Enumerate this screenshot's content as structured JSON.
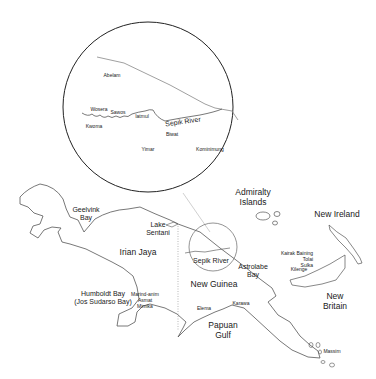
{
  "map": {
    "inset": {
      "labels": [
        {
          "id": "abelam",
          "text": "Abelam",
          "x": 112,
          "y": 76
        },
        {
          "id": "wosera",
          "text": "Wosera",
          "x": 99,
          "y": 110
        },
        {
          "id": "sawos",
          "text": "Sawos",
          "x": 118,
          "y": 113
        },
        {
          "id": "iatmul",
          "text": "Iatmul",
          "x": 142,
          "y": 117
        },
        {
          "id": "kwoma",
          "text": "Kwoma",
          "x": 94,
          "y": 127
        },
        {
          "id": "sepik-river-inset",
          "text": "Sepik River",
          "x": 183,
          "y": 122
        },
        {
          "id": "biwat",
          "text": "Biwat",
          "x": 172,
          "y": 135
        },
        {
          "id": "yimar",
          "text": "Yimar",
          "x": 148,
          "y": 150
        },
        {
          "id": "kominimung",
          "text": "Kominimung",
          "x": 210,
          "y": 150
        }
      ]
    },
    "regions": [
      {
        "id": "geelvink-bay",
        "text": "Geelvink\nBay",
        "x": 86,
        "y": 214,
        "size": "md"
      },
      {
        "id": "lake-sentani",
        "text": "Lake\nSentani",
        "x": 158,
        "y": 229,
        "size": "md"
      },
      {
        "id": "irian-jaya",
        "text": "Irian Jaya",
        "x": 138,
        "y": 253,
        "size": "lg"
      },
      {
        "id": "humboldt-bay",
        "text": "Humboldt Bay\n(Jos Sudarso Bay)",
        "x": 103,
        "y": 298,
        "size": "md"
      },
      {
        "id": "marind-anim",
        "text": "Marind-anim\nAsmat\nMimika",
        "x": 145,
        "y": 301,
        "size": "sm"
      },
      {
        "id": "admiralty-islands",
        "text": "Admiralty\nIslands",
        "x": 253,
        "y": 198,
        "size": "lg"
      },
      {
        "id": "new-ireland",
        "text": "New Ireland",
        "x": 337,
        "y": 215,
        "size": "lg"
      },
      {
        "id": "sepik-river",
        "text": "Sepik River",
        "x": 211,
        "y": 261,
        "size": "md"
      },
      {
        "id": "astrolabe-bay",
        "text": "Astrolabe\nBay",
        "x": 253,
        "y": 271,
        "size": "md"
      },
      {
        "id": "new-guinea",
        "text": "New Guinea",
        "x": 214,
        "y": 285,
        "size": "lg"
      },
      {
        "id": "kairak-baining",
        "text": "Kairak Baining\nTolai\nSulka",
        "x": 297,
        "y": 260,
        "size": "sm"
      },
      {
        "id": "kilenge",
        "text": "Kilenge",
        "x": 299,
        "y": 270,
        "size": "sm"
      },
      {
        "id": "new-britain",
        "text": "New\nBritain",
        "x": 335,
        "y": 302,
        "size": "lg"
      },
      {
        "id": "elema",
        "text": "Elema",
        "x": 204,
        "y": 309,
        "size": "sm"
      },
      {
        "id": "karawa",
        "text": "Karawa",
        "x": 241,
        "y": 304,
        "size": "sm"
      },
      {
        "id": "papuan-gulf",
        "text": "Papuan\nGulf",
        "x": 223,
        "y": 331,
        "size": "lg"
      },
      {
        "id": "massim",
        "text": "Massim",
        "x": 332,
        "y": 352,
        "size": "sm"
      }
    ]
  }
}
